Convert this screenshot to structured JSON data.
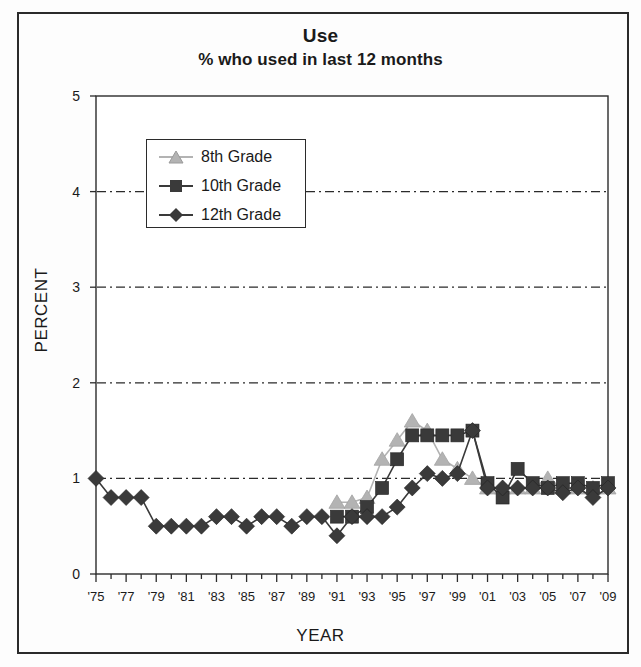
{
  "chart_data": {
    "type": "line",
    "title": "Use",
    "subtitle": "% who used in last 12 months",
    "xlabel": "YEAR",
    "ylabel": "PERCENT",
    "ylim": [
      0,
      5
    ],
    "ytick_values": [
      0,
      1,
      2,
      3,
      4,
      5
    ],
    "ytick_labels": [
      "0",
      "1",
      "2",
      "3",
      "4",
      "5"
    ],
    "gridlines_at": [
      1,
      2,
      3,
      4
    ],
    "grid": "horizontal-dashed",
    "xlim": [
      1975,
      2009
    ],
    "xtick_labels": [
      "'75",
      "'77",
      "'79",
      "'81",
      "'83",
      "'85",
      "'87",
      "'89",
      "'91",
      "'93",
      "'95",
      "'97",
      "'99",
      "'01",
      "'03",
      "'05",
      "'07",
      "'09"
    ],
    "xtick_years": [
      1975,
      1977,
      1979,
      1981,
      1983,
      1985,
      1987,
      1989,
      1991,
      1993,
      1995,
      1997,
      1999,
      2001,
      2003,
      2005,
      2007,
      2009
    ],
    "legend_position": "upper-left-inside",
    "series": [
      {
        "name": "8th Grade",
        "marker": "triangle",
        "color": "#b3b3b3",
        "x": [
          1991,
          1992,
          1993,
          1994,
          1995,
          1996,
          1997,
          1998,
          1999,
          2000,
          2001,
          2002,
          2003,
          2004,
          2005,
          2006,
          2007,
          2008,
          2009
        ],
        "values": [
          0.75,
          0.75,
          0.8,
          1.2,
          1.4,
          1.6,
          1.5,
          1.2,
          1.1,
          1.0,
          0.9,
          0.9,
          0.9,
          0.9,
          1.0,
          0.9,
          0.9,
          0.9,
          0.9
        ]
      },
      {
        "name": "10th Grade",
        "marker": "square",
        "color": "#3a3a3a",
        "x": [
          1991,
          1992,
          1993,
          1994,
          1995,
          1996,
          1997,
          1998,
          1999,
          2000,
          2001,
          2002,
          2003,
          2004,
          2005,
          2006,
          2007,
          2008,
          2009
        ],
        "values": [
          0.6,
          0.6,
          0.7,
          0.9,
          1.2,
          1.45,
          1.45,
          1.45,
          1.45,
          1.5,
          0.95,
          0.8,
          1.1,
          0.95,
          0.9,
          0.95,
          0.95,
          0.9,
          0.95
        ]
      },
      {
        "name": "12th Grade",
        "marker": "diamond",
        "color": "#3a3a3a",
        "x": [
          1975,
          1976,
          1977,
          1978,
          1979,
          1980,
          1981,
          1982,
          1983,
          1984,
          1985,
          1986,
          1987,
          1988,
          1989,
          1990,
          1991,
          1992,
          1993,
          1994,
          1995,
          1996,
          1997,
          1998,
          1999,
          2000,
          2001,
          2002,
          2003,
          2004,
          2005,
          2006,
          2007,
          2008,
          2009
        ],
        "values": [
          1.0,
          0.8,
          0.8,
          0.8,
          0.5,
          0.5,
          0.5,
          0.5,
          0.6,
          0.6,
          0.5,
          0.6,
          0.6,
          0.5,
          0.6,
          0.6,
          0.4,
          0.6,
          0.6,
          0.6,
          0.7,
          0.9,
          1.05,
          1.0,
          1.05,
          1.5,
          0.9,
          0.9,
          0.9,
          0.9,
          0.9,
          0.85,
          0.9,
          0.8,
          0.9
        ]
      }
    ]
  },
  "legend": {
    "items": [
      {
        "label": "8th Grade"
      },
      {
        "label": "10th Grade"
      },
      {
        "label": "12th Grade"
      }
    ]
  }
}
